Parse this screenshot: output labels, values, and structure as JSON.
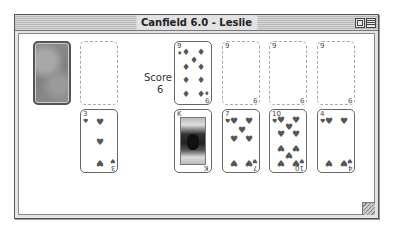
{
  "window": {
    "title": "Canfield 6.0 - Leslie",
    "buttons": [
      "zoom",
      "collapse"
    ]
  },
  "score": {
    "label": "Score",
    "value": "6"
  },
  "stock": {
    "type": "face-down deck"
  },
  "waste": {
    "type": "empty"
  },
  "reserve": {
    "rank": "3",
    "suit": "♥",
    "suit_name": "hearts"
  },
  "foundations": [
    {
      "rank": "9",
      "suit": "♦",
      "suit_name": "diamonds",
      "state": "card",
      "base_top": "9",
      "base_bottom": "9"
    },
    {
      "state": "empty",
      "base_top": "9",
      "base_bottom": "9"
    },
    {
      "state": "empty",
      "base_top": "9",
      "base_bottom": "9"
    },
    {
      "state": "empty",
      "base_top": "9",
      "base_bottom": "9"
    }
  ],
  "tableau": [
    {
      "rank": "K",
      "suit": "♠",
      "suit_name": "face card",
      "face": true
    },
    {
      "rank": "7",
      "suit": "♥",
      "suit_name": "hearts"
    },
    {
      "rank": "10",
      "suit": "♥",
      "suit_name": "hearts"
    },
    {
      "rank": "4",
      "suit": "♥",
      "suit_name": "hearts"
    }
  ]
}
